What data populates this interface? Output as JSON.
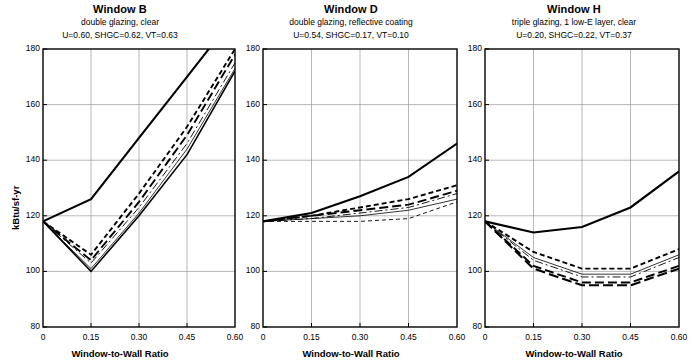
{
  "figure": {
    "yaxis_title": "kBtu/sf-yr",
    "xaxis_title": "Window-to-Wall Ratio"
  },
  "chart_data": {
    "type": "line",
    "title": "",
    "xlabel": "Window-to-Wall Ratio",
    "ylabel": "kBtu/sf-yr",
    "xlim": [
      0,
      0.6
    ],
    "ylim": [
      80,
      180
    ],
    "xticks": [
      "0",
      "0.15",
      "0.30",
      "0.45",
      "0.60"
    ],
    "xtick_values": [
      0,
      0.15,
      0.3,
      0.45,
      0.6
    ],
    "yticks": [
      "80",
      "100",
      "120",
      "140",
      "160",
      "180"
    ],
    "ytick_values": [
      80,
      100,
      120,
      140,
      160,
      180
    ],
    "grid": true,
    "legend": "none",
    "panels": [
      {
        "title": "Window B",
        "subtitle1": "double glazing, clear",
        "subtitle2": "U=0.60, SHGC=0.62, VT=0.63",
        "x": [
          0,
          0.15,
          0.3,
          0.45,
          0.6
        ],
        "series": [
          {
            "name": "series-1",
            "style": "solid-heavy",
            "values": [
              118,
              126,
              148,
              170,
              192
            ]
          },
          {
            "name": "series-2",
            "style": "short-dash",
            "values": [
              118,
              106,
              128,
              152,
              180
            ]
          },
          {
            "name": "series-3",
            "style": "long-dash",
            "values": [
              118,
              104,
              125,
              149,
              178
            ]
          },
          {
            "name": "series-4",
            "style": "thin-dash-dot",
            "values": [
              118,
              103,
              123,
              146,
              175
            ]
          },
          {
            "name": "series-5",
            "style": "thin-solid",
            "values": [
              118,
              101,
              121,
              144,
              173
            ]
          },
          {
            "name": "series-6",
            "style": "solid-heavy-thin",
            "values": [
              118,
              100,
              120,
              142,
              172
            ]
          }
        ]
      },
      {
        "title": "Window D",
        "subtitle1": "double glazing, reflective coating",
        "subtitle2": "U=0.54, SHGC=0.17, VT=0.10",
        "x": [
          0,
          0.15,
          0.3,
          0.45,
          0.6
        ],
        "series": [
          {
            "name": "series-1",
            "style": "solid-heavy",
            "values": [
              118,
              121,
              127,
              134,
              146
            ]
          },
          {
            "name": "series-2",
            "style": "short-dash",
            "values": [
              118,
              120,
              123,
              126,
              131
            ]
          },
          {
            "name": "series-3",
            "style": "long-dash",
            "values": [
              118,
              120,
              122,
              124,
              129
            ]
          },
          {
            "name": "series-4",
            "style": "thin-dash-dot",
            "values": [
              118,
              119,
              121,
              123,
              128
            ]
          },
          {
            "name": "series-5",
            "style": "thin-solid",
            "values": [
              118,
              119,
              120,
              122,
              126
            ]
          },
          {
            "name": "series-6",
            "style": "thin-short-dash",
            "values": [
              118,
              118,
              118,
              119,
              125
            ]
          }
        ]
      },
      {
        "title": "Window H",
        "subtitle1": "triple glazing, 1 low-E layer, clear",
        "subtitle2": "U=0.20, SHGC=0.22, VT=0.37",
        "x": [
          0,
          0.15,
          0.3,
          0.45,
          0.6
        ],
        "series": [
          {
            "name": "series-1",
            "style": "solid-heavy",
            "values": [
              118,
              114,
              116,
              123,
              136
            ]
          },
          {
            "name": "series-2",
            "style": "short-dash",
            "values": [
              118,
              107,
              101,
              101,
              108
            ]
          },
          {
            "name": "series-3",
            "style": "thin-solid",
            "values": [
              118,
              105,
              99,
              99,
              106
            ]
          },
          {
            "name": "series-4",
            "style": "thin-dash-dot",
            "values": [
              118,
              104,
              98,
              98,
              105
            ]
          },
          {
            "name": "series-5",
            "style": "long-dash",
            "values": [
              118,
              102,
              96,
              96,
              102
            ]
          },
          {
            "name": "series-6",
            "style": "long-dash-heavy",
            "values": [
              118,
              101,
              95,
              95,
              101
            ]
          }
        ]
      }
    ]
  }
}
